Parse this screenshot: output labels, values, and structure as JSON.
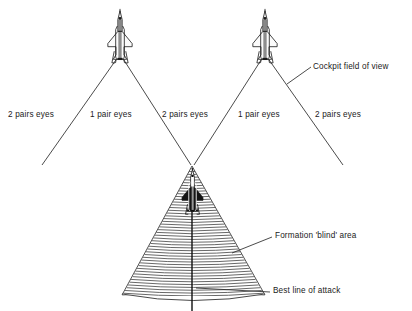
{
  "figure": {
    "type": "technical-diagram",
    "background_color": "#ffffff",
    "line_color": "#1a1a1a",
    "hatch_color": "#555555"
  },
  "labels": {
    "eyes_far_left": "2 pairs eyes",
    "eyes_left_inner": "1 pair eyes",
    "eyes_center": "2 pairs eyes",
    "eyes_right_inner": "1 pair eyes",
    "eyes_far_right": "2 pairs eyes",
    "cockpit_field_of_view": "Cockpit field of view",
    "formation_blind_area": "Formation 'blind' area",
    "best_line_of_attack": "Best line of attack"
  },
  "aircraft": [
    {
      "name": "left-fighter",
      "x": 120,
      "y": 36,
      "fill": "outline"
    },
    {
      "name": "right-fighter",
      "x": 265,
      "y": 36,
      "fill": "outline"
    },
    {
      "name": "attacker-fighter",
      "x": 192,
      "y": 196,
      "fill": "solid-dark"
    }
  ],
  "view_cones": [
    {
      "name": "left-cone",
      "apex_x": 120,
      "apex_y": 57,
      "left_end_x": 42,
      "left_end_y": 165,
      "right_end_x": 192,
      "right_end_y": 166
    },
    {
      "name": "right-cone",
      "apex_x": 265,
      "apex_y": 57,
      "left_end_x": 193,
      "left_end_y": 166,
      "right_end_x": 343,
      "right_end_y": 165
    }
  ],
  "blind_cone": {
    "name": "formation-blind-area",
    "apex_x": 192,
    "apex_y": 166,
    "base_left_x": 122,
    "base_right_x": 265,
    "base_y": 296,
    "hatch_line_count": 47,
    "hatch_style": "arc-hatched"
  },
  "attack_axis": {
    "name": "best-line-of-attack",
    "x": 192,
    "y_top": 212,
    "y_bottom": 311
  },
  "leader_lines": [
    {
      "name": "cockpit-fov-leader",
      "x1": 287,
      "y1": 84,
      "x2": 310,
      "y2": 68
    },
    {
      "name": "blind-area-leader",
      "x1": 232,
      "y1": 253,
      "x2": 272,
      "y2": 237
    },
    {
      "name": "attack-line-leader",
      "x1": 196,
      "y1": 288,
      "x2": 270,
      "y2": 293
    }
  ]
}
